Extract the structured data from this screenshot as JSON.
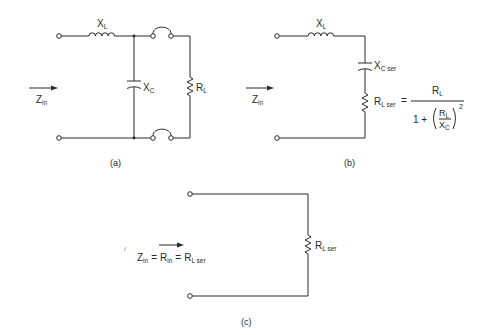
{
  "diagrams": {
    "a": {
      "caption": "(a)",
      "inductor": {
        "main": "X",
        "sub": "L"
      },
      "capacitor": {
        "main": "X",
        "sub": "C"
      },
      "resistor": {
        "main": "R",
        "sub": "L"
      },
      "input": {
        "main": "Z",
        "sub": "in"
      }
    },
    "b": {
      "caption": "(b)",
      "inductor": {
        "main": "X",
        "sub": "L"
      },
      "capacitor": {
        "main": "X",
        "sub": "C ser"
      },
      "resistor": {
        "main": "R",
        "sub": "L ser"
      },
      "input": {
        "main": "Z",
        "sub": "in"
      },
      "formula": {
        "equals": "=",
        "numerator": {
          "main": "R",
          "sub": "L"
        },
        "denominator_prefix": "1 +",
        "inner_numerator": {
          "main": "R",
          "sub": "L"
        },
        "inner_denominator": {
          "main": "X",
          "sub": "C"
        },
        "exponent": "2"
      }
    },
    "c": {
      "caption": "(c)",
      "resistor": {
        "main": "R",
        "sub": "L ser"
      },
      "equation": {
        "z": "Z",
        "z_sub": "in",
        "eq1": "=",
        "r": "R",
        "r_sub": "in",
        "eq2": "=",
        "rl": "R",
        "rl_sub": "L ser"
      }
    }
  }
}
